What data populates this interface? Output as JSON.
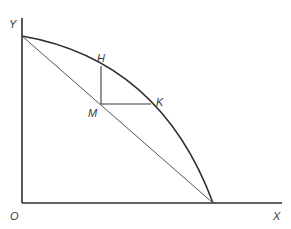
{
  "diagram": {
    "labels": {
      "y_axis": "Y",
      "x_axis": "X",
      "origin": "O",
      "h": "H",
      "m": "M",
      "k": "K"
    },
    "colors": {
      "axis": "#2e2e2e",
      "curve": "#2e2e2e",
      "chord": "#555555",
      "construction": "#3a3a3a"
    }
  }
}
